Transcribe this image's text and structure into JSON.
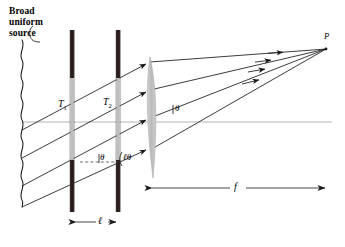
{
  "figure": {
    "kind": "optics-ray-diagram",
    "title_text": "Broad uniform source",
    "background_color": "#ffffff",
    "ink_color": "#1a1a1a",
    "barrier_color": "#2b1d1a",
    "slit_color": "#b8b8b8",
    "lens_color": "#c2c2c2",
    "axis_color": "#b0b0b0"
  },
  "labels": {
    "source_line1": "Broad",
    "source_line2": "uniform",
    "source_line3": "source",
    "slit_1": "T",
    "slit_1_sub": "1",
    "slit_2": "T",
    "slit_2_sub": "2",
    "theta_left": "θ",
    "theta_mid": "ℓθ",
    "theta_right": "θ",
    "focal_length": "f",
    "separation": "ℓ",
    "point_p": "P"
  },
  "geometry": {
    "optical_axis_y": 122,
    "optical_axis_x1": 22,
    "optical_axis_x2": 332,
    "source_x": 22,
    "source_y_top": 40,
    "source_y_bottom": 206,
    "barrier_1_x": 72,
    "barrier_2_x": 118,
    "barrier_y_top": 30,
    "barrier_y_bottom": 212,
    "slit_1_y_top": 78,
    "slit_1_y_bottom": 160,
    "slit_2_y_top": 78,
    "slit_2_y_bottom": 160,
    "lens_center_x": 150,
    "lens_y_top": 57,
    "lens_y_bottom": 178,
    "lens_half_width": 9,
    "focus_point_x": 326,
    "focus_point_y": 49,
    "f_arrow_y": 188,
    "f_arrow_x1": 146,
    "f_arrow_x2": 331,
    "l_arrow_y": 222,
    "ray_count": 4
  },
  "rays": {
    "incoming": [
      {
        "x1": 22,
        "y1": 130,
        "x2": 150,
        "y2": 62
      },
      {
        "x1": 22,
        "y1": 158,
        "x2": 150,
        "y2": 90
      },
      {
        "x1": 22,
        "y1": 186,
        "x2": 150,
        "y2": 118
      },
      {
        "x1": 22,
        "y1": 206,
        "x2": 150,
        "y2": 148
      }
    ],
    "converging": [
      {
        "x1": 150,
        "y1": 62,
        "x2": 326,
        "y2": 49
      },
      {
        "x1": 150,
        "y1": 90,
        "x2": 326,
        "y2": 49
      },
      {
        "x1": 150,
        "y1": 118,
        "x2": 326,
        "y2": 49
      },
      {
        "x1": 150,
        "y1": 148,
        "x2": 326,
        "y2": 49
      }
    ]
  }
}
